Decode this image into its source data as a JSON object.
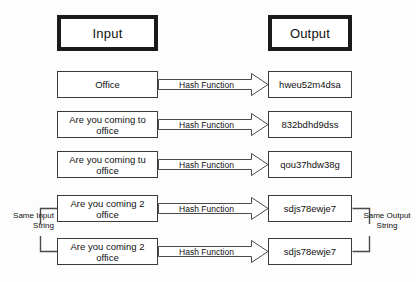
{
  "diagram": {
    "background_color": "#fdfdfd",
    "line_color": "#3a3a3a",
    "header_border_color": "#1a1a1a",
    "headers": {
      "input": "Input",
      "output": "Output"
    },
    "rows": [
      {
        "input": "Office",
        "operation": "Hash Function",
        "output": "hweu52m4dsa"
      },
      {
        "input": "Are you coming to office",
        "operation": "Hash Function",
        "output": "832bdhd9dss"
      },
      {
        "input": "Are you coming tu office",
        "operation": "Hash Function",
        "output": "qou37hdw38g"
      },
      {
        "input": "Are you coming 2 office",
        "operation": "Hash Function",
        "output": "sdjs78ewje7"
      },
      {
        "input": "Are you coming 2 office",
        "operation": "Hash Function",
        "output": "sdjs78ewje7"
      }
    ],
    "annotations": {
      "same_input": "Same Input String",
      "same_output": "Same Output String"
    }
  }
}
